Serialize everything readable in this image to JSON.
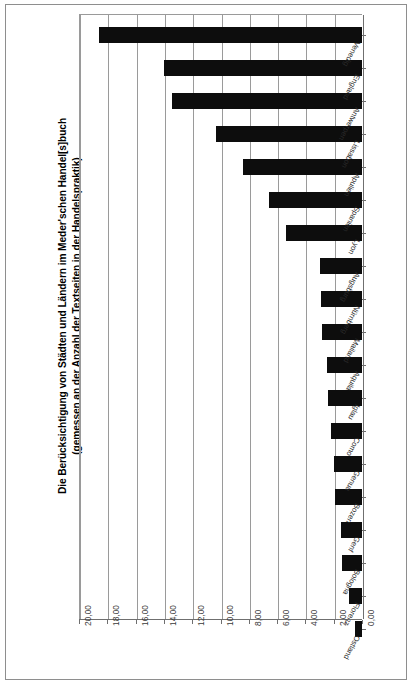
{
  "chart_data": {
    "type": "bar",
    "orientation": "horizontal",
    "title": "Die Berücksichtigung von Städten und Ländern im Meder'schen Handel[s]buch (gemessen an der Anzahl der Textseiten in der Handelspraktik)",
    "title_line1": "Die Berücksichtigung von Städten und Ländern im Meder'schen Handel[s]buch",
    "title_line2": "(gemessen an der Anzahl der Textseiten in der Handelspraktik)",
    "xlabel": "",
    "ylabel": "",
    "xlim": [
      0,
      20
    ],
    "x_axis_reversed": true,
    "grid": true,
    "legend": false,
    "bar_color": "#0d0d0d",
    "grid_color": "#9a9a9a",
    "tick_labels": [
      "20,00",
      "18,00",
      "16,00",
      "14,00",
      "12,00",
      "10,00",
      "8,00",
      "6,00",
      "4,00",
      "2,00",
      "0,00"
    ],
    "tick_values": [
      20,
      18,
      16,
      14,
      12,
      10,
      8,
      6,
      4,
      2,
      0
    ],
    "categories": [
      "Venedig",
      "England",
      "Antwerpen",
      "Lissabon",
      "Apulien",
      "Spanien",
      "Lyon",
      "Augsburg",
      "Nürnberg",
      "Mailand",
      "Aquila",
      "Iglau",
      "Como",
      "Genua",
      "Bozen",
      "Genf",
      "Bologna",
      "Florenz",
      "Ostland"
    ],
    "values": [
      18.6,
      14.0,
      13.4,
      10.3,
      8.4,
      6.6,
      5.4,
      3.0,
      2.9,
      2.8,
      2.5,
      2.4,
      2.2,
      2.0,
      1.9,
      1.5,
      1.4,
      0.9,
      0.5
    ]
  }
}
